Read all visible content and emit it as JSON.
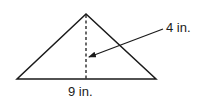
{
  "diagram": {
    "shape": "triangle",
    "labels": {
      "height": "4 in.",
      "base": "9 in."
    },
    "colors": {
      "stroke": "#1a1a1a",
      "background": "#ffffff"
    }
  }
}
